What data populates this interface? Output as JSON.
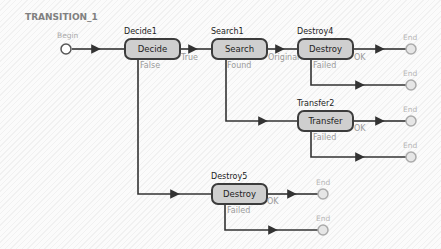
{
  "diagram": {
    "title": "TRANSITION_1",
    "colors": {
      "node_fill": "#cfcfcf",
      "node_border": "#3c3c3c",
      "edge": "#333333",
      "terminal": "#b0b0b0",
      "port_label": "#9a9a9a"
    },
    "start": {
      "label": "Begin"
    },
    "nodes": [
      {
        "id": "Decide1",
        "name": "Decide1",
        "type": "Decide",
        "ports": {
          "true": "True",
          "false": "False"
        }
      },
      {
        "id": "Search1",
        "name": "Search1",
        "type": "Search",
        "ports": {
          "original": "Original",
          "found": "Found"
        }
      },
      {
        "id": "Destroy4",
        "name": "Destroy4",
        "type": "Destroy",
        "ports": {
          "ok": "OK",
          "failed": "Failed"
        }
      },
      {
        "id": "Transfer2",
        "name": "Transfer2",
        "type": "Transfer",
        "ports": {
          "ok": "OK",
          "failed": "Failed"
        }
      },
      {
        "id": "Destroy5",
        "name": "Destroy5",
        "type": "Destroy",
        "ports": {
          "ok": "OK",
          "failed": "Failed"
        }
      }
    ],
    "ends": [
      "End",
      "End",
      "End",
      "End",
      "End",
      "End"
    ],
    "edges": [
      {
        "from": "Begin",
        "to": "Decide1"
      },
      {
        "from": "Decide1",
        "port": "True",
        "to": "Search1"
      },
      {
        "from": "Decide1",
        "port": "False",
        "to": "Destroy5"
      },
      {
        "from": "Search1",
        "port": "Original",
        "to": "Destroy4"
      },
      {
        "from": "Search1",
        "port": "Found",
        "to": "Transfer2"
      },
      {
        "from": "Destroy4",
        "port": "OK",
        "to": "End"
      },
      {
        "from": "Destroy4",
        "port": "Failed",
        "to": "End"
      },
      {
        "from": "Transfer2",
        "port": "OK",
        "to": "End"
      },
      {
        "from": "Transfer2",
        "port": "Failed",
        "to": "End"
      },
      {
        "from": "Destroy5",
        "port": "OK",
        "to": "End"
      },
      {
        "from": "Destroy5",
        "port": "Failed",
        "to": "End"
      }
    ]
  }
}
